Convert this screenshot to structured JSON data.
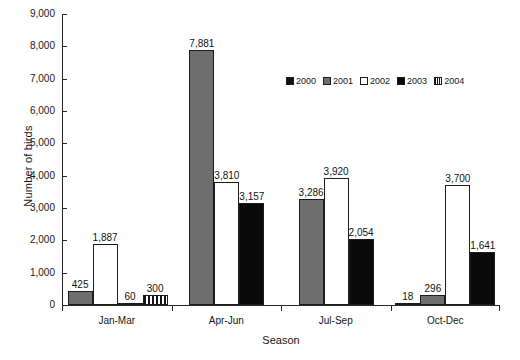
{
  "chart_data": {
    "type": "bar",
    "title": "",
    "xlabel": "Season",
    "ylabel": "Number of birds",
    "categories": [
      "Jan-Mar",
      "Apr-Jun",
      "Jul-Sep",
      "Oct-Dec"
    ],
    "ylim": [
      0,
      9000
    ],
    "yticks": [
      "0",
      "1,000",
      "2,000",
      "3,000",
      "4,000",
      "5,000",
      "6,000",
      "7,000",
      "8,000",
      "9,000"
    ],
    "ytick_values": [
      0,
      1000,
      2000,
      3000,
      4000,
      5000,
      6000,
      7000,
      8000,
      9000
    ],
    "grid": false,
    "legend_position": "upper-center-right",
    "series": [
      {
        "name": "2000",
        "key": "s2000",
        "color": "#111111",
        "pattern": "solid",
        "values": [
          null,
          null,
          null,
          18
        ],
        "labels": [
          "",
          "",
          "",
          "18"
        ]
      },
      {
        "name": "2001",
        "key": "s2001",
        "color": "#6e6e6e",
        "pattern": "solid",
        "values": [
          425,
          7881,
          3286,
          296
        ],
        "labels": [
          "425",
          "7,881",
          "3,286",
          "296"
        ]
      },
      {
        "name": "2002",
        "key": "s2002",
        "color": "#ffffff",
        "pattern": "solid",
        "values": [
          1887,
          3810,
          3920,
          3700
        ],
        "labels": [
          "1,887",
          "3,810",
          "3,920",
          "3,700"
        ]
      },
      {
        "name": "2003",
        "key": "s2003",
        "color": "#0a0a0a",
        "pattern": "solid",
        "values": [
          60,
          3157,
          2054,
          1641
        ],
        "labels": [
          "60",
          "3,157",
          "2,054",
          "1,641"
        ]
      },
      {
        "name": "2004",
        "key": "s2004",
        "color": "#ffffff",
        "pattern": "vertical-hatch",
        "values": [
          300,
          null,
          null,
          null
        ],
        "labels": [
          "300",
          "",
          "",
          ""
        ]
      }
    ],
    "groups": [
      {
        "category": "Jan-Mar",
        "bars": [
          {
            "series": "2001",
            "key": "s2001",
            "value": 425,
            "label": "425"
          },
          {
            "series": "2002",
            "key": "s2002",
            "value": 1887,
            "label": "1,887"
          },
          {
            "series": "2003",
            "key": "s2003",
            "value": 60,
            "label": "60"
          },
          {
            "series": "2004",
            "key": "s2004",
            "value": 300,
            "label": "300"
          }
        ]
      },
      {
        "category": "Apr-Jun",
        "bars": [
          {
            "series": "2001",
            "key": "s2001",
            "value": 7881,
            "label": "7,881"
          },
          {
            "series": "2002",
            "key": "s2002",
            "value": 3810,
            "label": "3,810"
          },
          {
            "series": "2003",
            "key": "s2003",
            "value": 3157,
            "label": "3,157"
          }
        ]
      },
      {
        "category": "Jul-Sep",
        "bars": [
          {
            "series": "2001",
            "key": "s2001",
            "value": 3286,
            "label": "3,286"
          },
          {
            "series": "2002",
            "key": "s2002",
            "value": 3920,
            "label": "3,920"
          },
          {
            "series": "2003",
            "key": "s2003",
            "value": 2054,
            "label": "2,054"
          }
        ]
      },
      {
        "category": "Oct-Dec",
        "bars": [
          {
            "series": "2000",
            "key": "s2000",
            "value": 18,
            "label": "18"
          },
          {
            "series": "2001",
            "key": "s2001",
            "value": 296,
            "label": "296"
          },
          {
            "series": "2002",
            "key": "s2002",
            "value": 3700,
            "label": "3,700"
          },
          {
            "series": "2003",
            "key": "s2003",
            "value": 1641,
            "label": "1,641"
          }
        ]
      }
    ],
    "legend": [
      {
        "label": "2000",
        "key": "s2000"
      },
      {
        "label": "2001",
        "key": "s2001"
      },
      {
        "label": "2002",
        "key": "s2002"
      },
      {
        "label": "2003",
        "key": "s2003"
      },
      {
        "label": "2004",
        "key": "s2004"
      }
    ]
  }
}
